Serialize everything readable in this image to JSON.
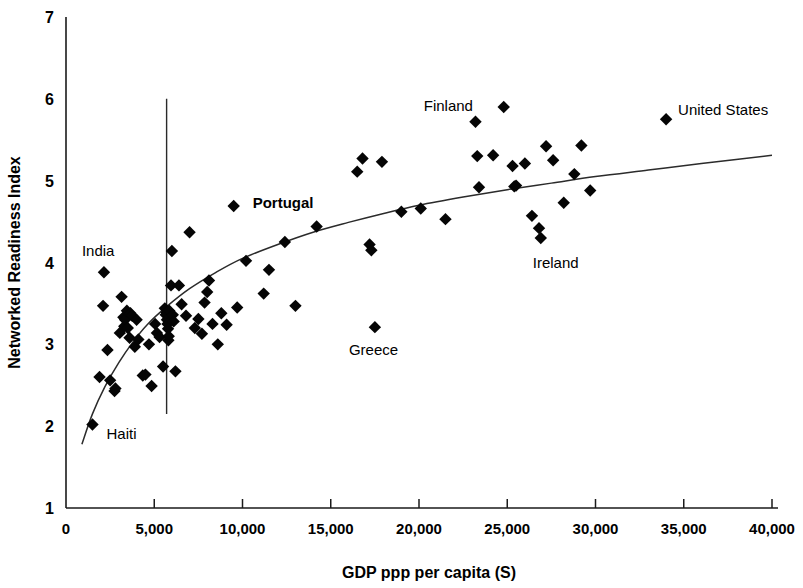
{
  "chart_data": {
    "type": "scatter",
    "title": "",
    "xlabel": "GDP ppp per capita (S)",
    "ylabel": "Networked Readiness Index",
    "xlim": [
      0,
      40000
    ],
    "ylim": [
      1,
      7
    ],
    "grid": false,
    "legend": "none",
    "x_ticks": [
      0,
      5000,
      10000,
      15000,
      20000,
      25000,
      30000,
      35000,
      40000
    ],
    "x_tick_labels": [
      "0",
      "5,000",
      "10,000",
      "15,000",
      "20,000",
      "25,000",
      "30,000",
      "35,000",
      "40,000"
    ],
    "y_ticks": [
      1,
      2,
      3,
      4,
      5,
      6,
      7
    ],
    "y_tick_labels": [
      "1",
      "2",
      "3",
      "4",
      "5",
      "6",
      "7"
    ],
    "marker_shape": "diamond",
    "marker_color": "#050505",
    "curve_color": "#2b2b2b",
    "reference_line": {
      "orientation": "vertical",
      "x": 5700,
      "y_from": 2.15,
      "y_to": 6.0,
      "color": "#2a2a2a"
    },
    "trend_curve": {
      "description": "logarithmic best-fit curve",
      "points": [
        [
          900,
          1.78
        ],
        [
          1500,
          2.15
        ],
        [
          2200,
          2.48
        ],
        [
          3000,
          2.78
        ],
        [
          3800,
          3.03
        ],
        [
          4600,
          3.24
        ],
        [
          5700,
          3.46
        ],
        [
          7000,
          3.68
        ],
        [
          8500,
          3.88
        ],
        [
          10000,
          4.05
        ],
        [
          12000,
          4.22
        ],
        [
          14000,
          4.37
        ],
        [
          16000,
          4.49
        ],
        [
          18000,
          4.6
        ],
        [
          20000,
          4.7
        ],
        [
          22500,
          4.8
        ],
        [
          25000,
          4.89
        ],
        [
          27500,
          4.97
        ],
        [
          30000,
          5.05
        ],
        [
          33000,
          5.13
        ],
        [
          36000,
          5.21
        ],
        [
          40000,
          5.31
        ]
      ]
    },
    "points": [
      [
        1500,
        2.02
      ],
      [
        1900,
        2.6
      ],
      [
        2150,
        3.88
      ],
      [
        2100,
        3.47
      ],
      [
        2350,
        2.93
      ],
      [
        2500,
        2.56
      ],
      [
        2750,
        2.43
      ],
      [
        2800,
        2.46
      ],
      [
        3050,
        3.14
      ],
      [
        3150,
        3.58
      ],
      [
        3250,
        3.33
      ],
      [
        3300,
        3.22
      ],
      [
        3350,
        3.3
      ],
      [
        3450,
        3.41
      ],
      [
        3500,
        3.2
      ],
      [
        3600,
        3.08
      ],
      [
        3650,
        3.38
      ],
      [
        3750,
        3.35
      ],
      [
        3900,
        2.97
      ],
      [
        4000,
        3.3
      ],
      [
        4100,
        3.06
      ],
      [
        4350,
        2.62
      ],
      [
        4500,
        2.63
      ],
      [
        4700,
        3.0
      ],
      [
        4850,
        2.49
      ],
      [
        5050,
        3.25
      ],
      [
        5150,
        3.14
      ],
      [
        5300,
        3.09
      ],
      [
        5500,
        2.73
      ],
      [
        5600,
        3.44
      ],
      [
        5650,
        3.36
      ],
      [
        5700,
        3.39
      ],
      [
        5720,
        3.3
      ],
      [
        5750,
        3.25
      ],
      [
        5780,
        3.19
      ],
      [
        5800,
        3.05
      ],
      [
        5820,
        3.1
      ],
      [
        5850,
        3.41
      ],
      [
        5950,
        3.72
      ],
      [
        6000,
        4.14
      ],
      [
        6050,
        3.36
      ],
      [
        6100,
        3.28
      ],
      [
        6200,
        2.67
      ],
      [
        6400,
        3.72
      ],
      [
        6550,
        3.49
      ],
      [
        6800,
        3.35
      ],
      [
        7000,
        4.37
      ],
      [
        7300,
        3.2
      ],
      [
        7500,
        3.31
      ],
      [
        7700,
        3.13
      ],
      [
        7850,
        3.51
      ],
      [
        8000,
        3.64
      ],
      [
        8100,
        3.78
      ],
      [
        8300,
        3.25
      ],
      [
        8600,
        3.0
      ],
      [
        8800,
        3.38
      ],
      [
        9100,
        3.24
      ],
      [
        9500,
        4.69
      ],
      [
        9700,
        3.45
      ],
      [
        10200,
        4.02
      ],
      [
        11200,
        3.62
      ],
      [
        11500,
        3.91
      ],
      [
        12400,
        4.25
      ],
      [
        13000,
        3.47
      ],
      [
        14200,
        4.44
      ],
      [
        16500,
        5.11
      ],
      [
        16800,
        5.27
      ],
      [
        17200,
        4.22
      ],
      [
        17300,
        4.15
      ],
      [
        17500,
        3.21
      ],
      [
        17900,
        5.23
      ],
      [
        19000,
        4.62
      ],
      [
        20100,
        4.66
      ],
      [
        21500,
        4.53
      ],
      [
        23200,
        5.72
      ],
      [
        23300,
        5.3
      ],
      [
        23400,
        4.92
      ],
      [
        24200,
        5.31
      ],
      [
        24800,
        5.9
      ],
      [
        25300,
        5.18
      ],
      [
        25400,
        4.93
      ],
      [
        25500,
        4.94
      ],
      [
        26000,
        5.21
      ],
      [
        26400,
        4.57
      ],
      [
        26800,
        4.42
      ],
      [
        26900,
        4.3
      ],
      [
        27200,
        5.42
      ],
      [
        27600,
        5.25
      ],
      [
        28200,
        4.73
      ],
      [
        28800,
        5.08
      ],
      [
        29200,
        5.43
      ],
      [
        29700,
        4.88
      ],
      [
        34000,
        5.75
      ]
    ],
    "annotations": [
      {
        "text": "Haiti",
        "x": 1500,
        "y": 2.02,
        "bold": false,
        "dx": 14,
        "dy": 14
      },
      {
        "text": "India",
        "x": 2150,
        "y": 3.88,
        "bold": false,
        "dx": -22,
        "dy": -16
      },
      {
        "text": "Portugal",
        "x": 14200,
        "y": 4.44,
        "bold": true,
        "dx": -64,
        "dy": -18
      },
      {
        "text": "Greece",
        "x": 17500,
        "y": 3.21,
        "bold": false,
        "dx": -26,
        "dy": 28
      },
      {
        "text": "Finland",
        "x": 24800,
        "y": 5.9,
        "bold": false,
        "dx": -80,
        "dy": 4
      },
      {
        "text": "Ireland",
        "x": 26900,
        "y": 4.3,
        "bold": false,
        "dx": -8,
        "dy": 30
      },
      {
        "text": "United States",
        "x": 34000,
        "y": 5.75,
        "bold": false,
        "dx": 12,
        "dy": -4
      }
    ]
  }
}
